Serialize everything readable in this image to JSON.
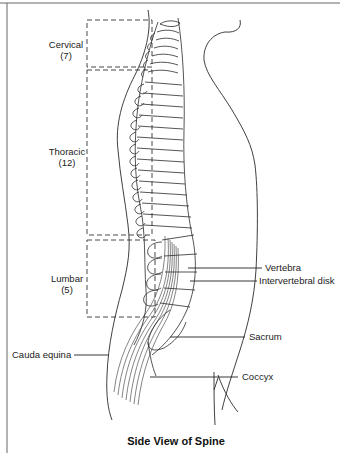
{
  "figure": {
    "title": "Side View of Spine",
    "regions": [
      {
        "name": "Cervical",
        "count": "(7)"
      },
      {
        "name": "Thoracic",
        "count": "(12)"
      },
      {
        "name": "Lumbar",
        "count": "(5)"
      }
    ],
    "callouts": {
      "vertebra": "Vertebra",
      "intervertebral_disk": "Intervertebral disk",
      "sacrum": "Sacrum",
      "coccyx": "Coccyx",
      "cauda_equina": "Cauda equina"
    },
    "colors": {
      "line": "#2a2a2a",
      "frame": "#555555",
      "background": "#ffffff"
    }
  }
}
